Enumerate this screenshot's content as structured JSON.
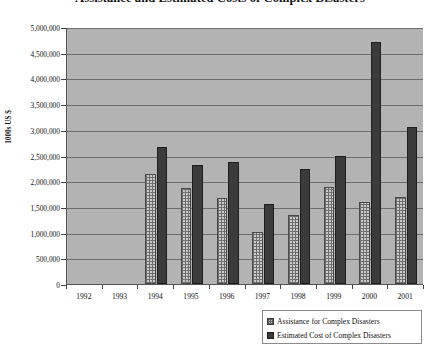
{
  "chart_data": {
    "type": "bar",
    "title": "Assistance and Estimated Costs of Complex Disasters",
    "xlabel": "",
    "ylabel": "1000s US $",
    "categories": [
      "1992",
      "1993",
      "1994",
      "1995",
      "1996",
      "1997",
      "1998",
      "1999",
      "2000",
      "2001"
    ],
    "series": [
      {
        "name": "Assistance for  Complex Disasters",
        "color": "#c9c9c9",
        "pattern": "checkered",
        "values": [
          null,
          null,
          2150000,
          1870000,
          1670000,
          1020000,
          1340000,
          1890000,
          1600000,
          1700000
        ]
      },
      {
        "name": "Estimated Cost of Complex Disasters",
        "color": "#3b3b3b",
        "pattern": "solid",
        "values": [
          null,
          null,
          2670000,
          2320000,
          2380000,
          1550000,
          2240000,
          2500000,
          4700000,
          3050000
        ]
      }
    ],
    "ylim": [
      0,
      5000000
    ],
    "ytick_step": 500000,
    "ytick_labels": [
      "0",
      "500,000",
      "1,000,000",
      "1,500,000",
      "2,000,000",
      "2,500,000",
      "3,000,000",
      "3,500,000",
      "4,000,000",
      "4,500,000",
      "5,000,000"
    ],
    "grid": true,
    "legend_position": "bottom-right",
    "plot_background": "#b3b3b3"
  }
}
